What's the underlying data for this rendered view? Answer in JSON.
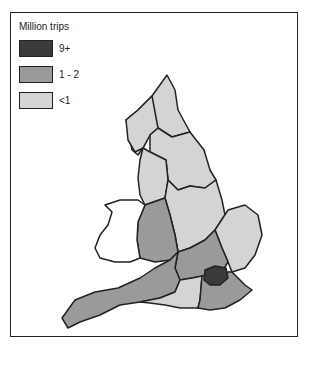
{
  "legend": {
    "title": "Million trips",
    "items": [
      {
        "label": "9+",
        "color": "#3a3a3a"
      },
      {
        "label": "1 - 2",
        "color": "#9a9a9a"
      },
      {
        "label": "<1",
        "color": "#d4d4d4"
      }
    ]
  },
  "map": {
    "subject": "England regions by million trips",
    "regions": [
      {
        "name": "North West",
        "category": "<1"
      },
      {
        "name": "Cumbria / North",
        "category": "<1"
      },
      {
        "name": "Yorkshire",
        "category": "<1"
      },
      {
        "name": "North West England",
        "category": "<1"
      },
      {
        "name": "West Midlands",
        "category": "1 - 2"
      },
      {
        "name": "East Midlands",
        "category": "<1"
      },
      {
        "name": "East Anglia",
        "category": "<1"
      },
      {
        "name": "South West",
        "category": "1 - 2"
      },
      {
        "name": "Thames & Chilterns",
        "category": "1 - 2"
      },
      {
        "name": "Southern",
        "category": "<1"
      },
      {
        "name": "South East",
        "category": "1 - 2"
      },
      {
        "name": "London",
        "category": "9+"
      }
    ]
  }
}
